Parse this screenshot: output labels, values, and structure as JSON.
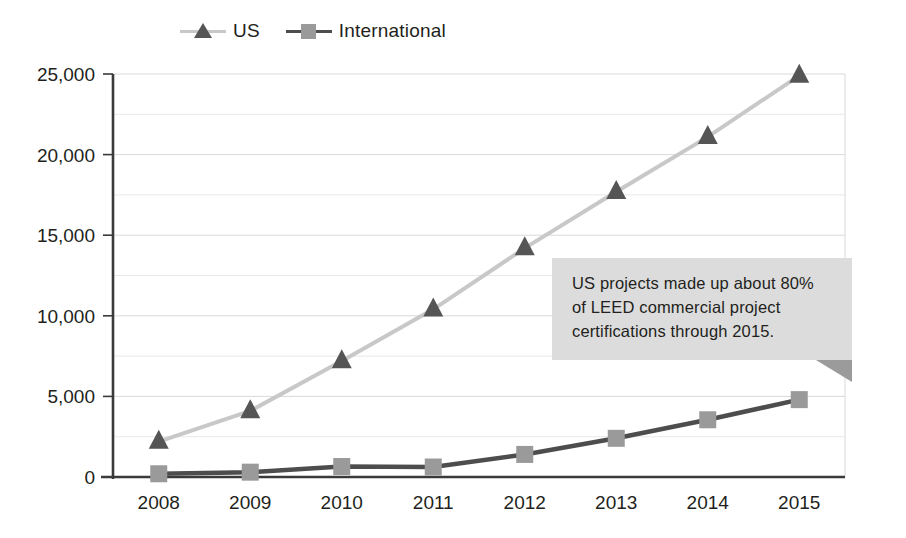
{
  "chart_data": {
    "type": "line",
    "title": "",
    "subtitle": "",
    "xlabel": "",
    "ylabel": "",
    "categories": [
      "2008",
      "2009",
      "2010",
      "2011",
      "2012",
      "2013",
      "2014",
      "2015"
    ],
    "series": [
      {
        "name": "US",
        "marker": "triangle",
        "line_color": "#c8c8c8",
        "marker_color": "#555555",
        "values": [
          2200,
          4100,
          7200,
          10400,
          14200,
          17700,
          21100,
          24900
        ]
      },
      {
        "name": "International",
        "marker": "square",
        "line_color": "#4d4d4d",
        "marker_color": "#9a9a9a",
        "values": [
          200,
          300,
          650,
          620,
          1400,
          2400,
          3550,
          4800
        ]
      }
    ],
    "ylim": [
      0,
      25000
    ],
    "y_ticks": [
      0,
      5000,
      10000,
      15000,
      20000,
      25000
    ],
    "y_tick_labels": [
      "0",
      "5,000",
      "10,000",
      "15,000",
      "20,000",
      "25,000"
    ],
    "y_minor_ticks": [
      2500,
      7500,
      12500,
      17500,
      22500
    ],
    "grid": true,
    "grid_color": "#d9d9d9",
    "legend_position": "top-left",
    "annotations": [
      {
        "text": "US projects made up about 80% of LEED commercial project certifications through 2015.",
        "background": "#dcdcdc",
        "fold_color": "#9b9b9b"
      }
    ]
  },
  "legend": {
    "entries": [
      {
        "label": "US",
        "icon": "triangle-marker-icon"
      },
      {
        "label": "International",
        "icon": "square-marker-icon"
      }
    ]
  },
  "axes": {
    "y_labels": [
      "25,000",
      "20,000",
      "15,000",
      "10,000",
      "5,000",
      "0"
    ],
    "x_labels": [
      "2008",
      "2009",
      "2010",
      "2011",
      "2012",
      "2013",
      "2014",
      "2015"
    ]
  },
  "callout": {
    "line1": "US projects made up about 80%",
    "line2": "of LEED commercial project",
    "line3": "certifications through 2015.",
    "full_text": "US projects made up about 80% of LEED commercial project certifications through 2015."
  },
  "colors": {
    "us_line": "#c8c8c8",
    "us_marker": "#555555",
    "intl_line": "#4d4d4d",
    "intl_marker": "#9a9a9a",
    "axis": "#3a3a3a",
    "grid": "#d9d9d9",
    "callout_bg": "#dcdcdc",
    "text": "#231f20"
  }
}
